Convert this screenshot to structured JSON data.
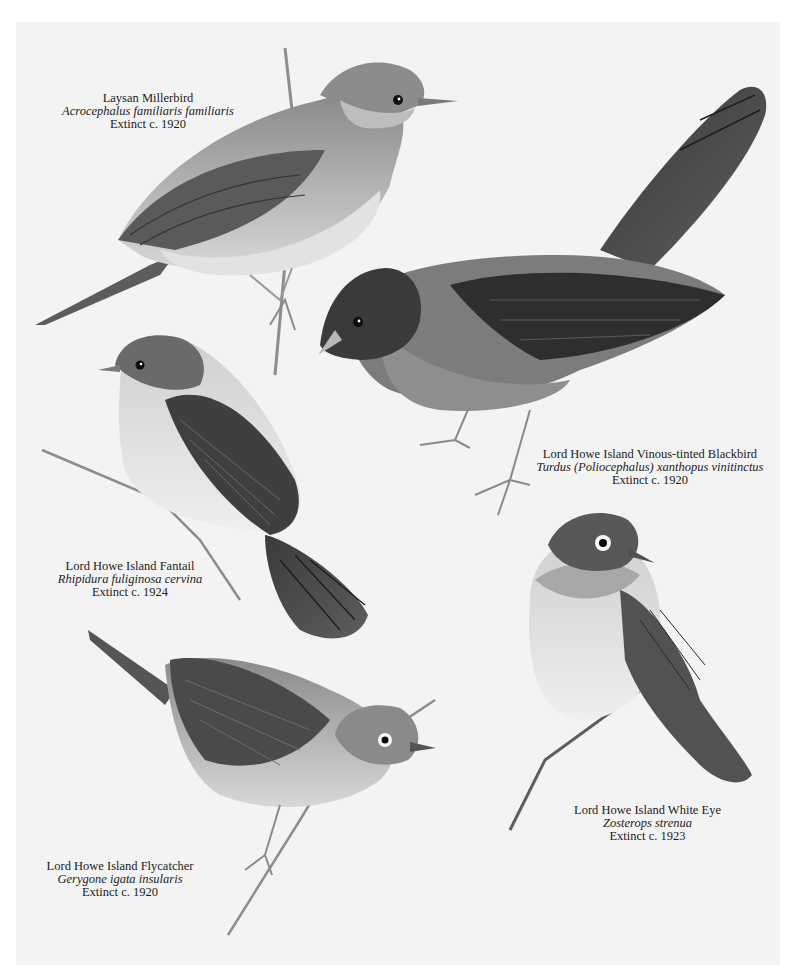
{
  "plate": {
    "background": "#f3f3f3",
    "page_background": "#ffffff",
    "birds": [
      {
        "id": "laysan-millerbird",
        "common_name": "Laysan Millerbird",
        "scientific_name": "Acrocephalus familiaris familiaris",
        "status": "Extinct c. 1920"
      },
      {
        "id": "vinous-tinted-blackbird",
        "common_name": "Lord Howe Island Vinous-tinted Blackbird",
        "scientific_name": "Turdus (Poliocephalus) xanthopus vinitinctus",
        "status": "Extinct c. 1920"
      },
      {
        "id": "fantail",
        "common_name": "Lord Howe Island Fantail",
        "scientific_name": "Rhipidura fuliginosa cervina",
        "status": "Extinct c. 1924"
      },
      {
        "id": "white-eye",
        "common_name": "Lord Howe Island White Eye",
        "scientific_name": "Zosterops strenua",
        "status": "Extinct c. 1923"
      },
      {
        "id": "flycatcher",
        "common_name": "Lord Howe Island Flycatcher",
        "scientific_name": "Gerygone igata insularis",
        "status": "Extinct c. 1920"
      }
    ]
  }
}
